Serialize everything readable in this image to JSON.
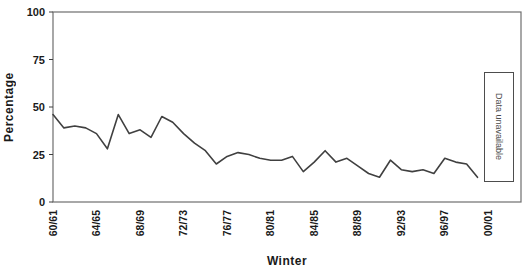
{
  "chart_data": {
    "type": "line",
    "title": "",
    "xlabel": "Winter",
    "ylabel": "Percentage",
    "categories": [
      "60/61",
      "61/62",
      "62/63",
      "63/64",
      "64/65",
      "65/66",
      "66/67",
      "67/68",
      "68/69",
      "69/70",
      "70/71",
      "71/72",
      "72/73",
      "73/74",
      "74/75",
      "75/76",
      "76/77",
      "77/78",
      "78/79",
      "79/80",
      "80/81",
      "81/82",
      "82/83",
      "83/84",
      "84/85",
      "85/86",
      "86/87",
      "87/88",
      "88/89",
      "89/90",
      "90/91",
      "91/92",
      "92/93",
      "93/94",
      "94/95",
      "95/96",
      "96/97",
      "97/98",
      "98/99",
      "99/00"
    ],
    "values": [
      46,
      39,
      40,
      39,
      36,
      28,
      46,
      36,
      38,
      34,
      45,
      42,
      36,
      31,
      27,
      20,
      24,
      26,
      25,
      23,
      22,
      22,
      24,
      16,
      21,
      27,
      21,
      23,
      19,
      15,
      13,
      22,
      17,
      16,
      17,
      15,
      23,
      21,
      20,
      13
    ],
    "ylim": [
      0,
      100
    ],
    "yticks": [
      0,
      25,
      50,
      75,
      100
    ],
    "x_tick_labels": [
      "60/61",
      "64/65",
      "68/69",
      "72/73",
      "76/77",
      "80/81",
      "84/85",
      "88/89",
      "92/93",
      "96/97",
      "00/01"
    ],
    "x_tick_slot_indices": [
      0,
      4,
      8,
      12,
      16,
      20,
      24,
      28,
      32,
      36,
      40
    ],
    "x_total_slots": 44,
    "grid": "off",
    "legend": "none",
    "line_color": "#404040",
    "frame_color": "#6e6e6e",
    "annotation": {
      "text": "Data unavailable"
    }
  }
}
